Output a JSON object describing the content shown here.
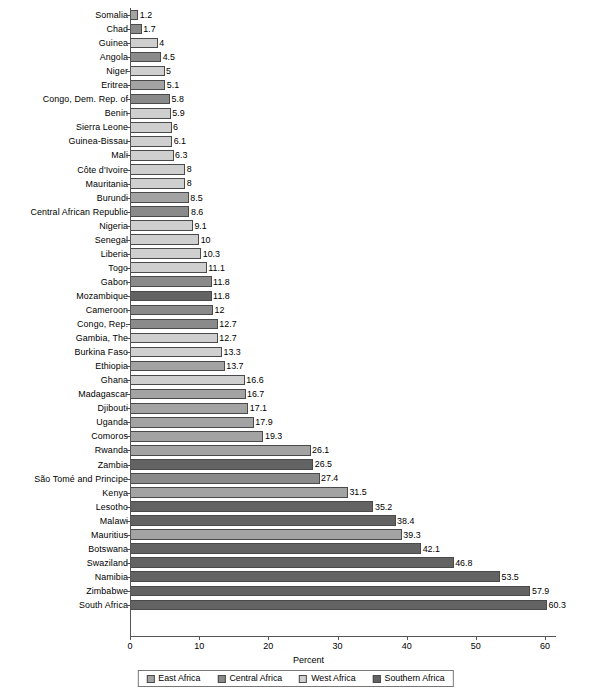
{
  "chart_data": {
    "type": "bar",
    "orientation": "horizontal",
    "title": "",
    "xlabel": "Percent",
    "ylabel": "",
    "xlim": [
      0,
      63
    ],
    "xticks": [
      0,
      10,
      20,
      30,
      40,
      50,
      60
    ],
    "grid": false,
    "legend_position": "bottom",
    "categories": [
      "Somalia",
      "Chad",
      "Guinea",
      "Angola",
      "Niger",
      "Eritrea",
      "Congo, Dem. Rep. of",
      "Benin",
      "Sierra Leone",
      "Guinea-Bissau",
      "Mali",
      "Côte d'Ivoire",
      "Mauritania",
      "Burundi",
      "Central African Republic",
      "Nigeria",
      "Senegal",
      "Liberia",
      "Togo",
      "Gabon",
      "Mozambique",
      "Cameroon",
      "Congo, Rep.",
      "Gambia, The",
      "Burkina Faso",
      "Ethiopia",
      "Ghana",
      "Madagascar",
      "Djibouti",
      "Uganda",
      "Comoros",
      "Rwanda",
      "Zambia",
      "São Tomé and Principe",
      "Kenya",
      "Lesotho",
      "Malawi",
      "Mauritius",
      "Botswana",
      "Swaziland",
      "Namibia",
      "Zimbabwe",
      "South Africa"
    ],
    "values": [
      1.2,
      1.7,
      4,
      4.5,
      5,
      5.1,
      5.8,
      5.9,
      6,
      6.1,
      6.3,
      8,
      8,
      8.5,
      8.6,
      9.1,
      10,
      10.3,
      11.1,
      11.8,
      11.8,
      12,
      12.7,
      12.7,
      13.3,
      13.7,
      16.6,
      16.7,
      17.1,
      17.9,
      19.3,
      26.1,
      26.5,
      27.4,
      31.5,
      35.2,
      38.4,
      39.3,
      42.1,
      46.8,
      53.5,
      57.9,
      60.3
    ],
    "value_labels": [
      "1.2",
      "1.7",
      "4",
      "4.5",
      "5",
      "5.1",
      "5.8",
      "5.9",
      "6",
      "6.1",
      "6.3",
      "8",
      "8",
      "8.5",
      "8.6",
      "9.1",
      "10",
      "10.3",
      "11.1",
      "11.8",
      "11.8",
      "12",
      "12.7",
      "12.7",
      "13.3",
      "13.7",
      "16.6",
      "16.7",
      "17.1",
      "17.9",
      "19.3",
      "26.1",
      "26.5",
      "27.4",
      "31.5",
      "35.2",
      "38.4",
      "39.3",
      "42.1",
      "46.8",
      "53.5",
      "57.9",
      "60.3"
    ],
    "groups": [
      "East Africa",
      "Central Africa",
      "West Africa",
      "Central Africa",
      "West Africa",
      "East Africa",
      "Central Africa",
      "West Africa",
      "West Africa",
      "West Africa",
      "West Africa",
      "West Africa",
      "West Africa",
      "East Africa",
      "Central Africa",
      "West Africa",
      "West Africa",
      "West Africa",
      "West Africa",
      "Central Africa",
      "Southern Africa",
      "Central Africa",
      "Central Africa",
      "West Africa",
      "West Africa",
      "East Africa",
      "West Africa",
      "East Africa",
      "East Africa",
      "East Africa",
      "East Africa",
      "East Africa",
      "Southern Africa",
      "Central Africa",
      "East Africa",
      "Southern Africa",
      "Southern Africa",
      "East Africa",
      "Southern Africa",
      "Southern Africa",
      "Southern Africa",
      "Southern Africa",
      "Southern Africa"
    ],
    "group_colors": {
      "East Africa": "#a3a3a3",
      "Central Africa": "#8a8a8a",
      "West Africa": "#cfcfcf",
      "Southern Africa": "#636363"
    }
  },
  "axis": {
    "x_title": "Percent",
    "tick_labels": [
      "0",
      "10",
      "20",
      "30",
      "40",
      "50",
      "60"
    ]
  },
  "legend": {
    "items": [
      {
        "label": "East Africa",
        "color": "#a3a3a3"
      },
      {
        "label": "Central Africa",
        "color": "#8a8a8a"
      },
      {
        "label": "West Africa",
        "color": "#cfcfcf"
      },
      {
        "label": "Southern Africa",
        "color": "#636363"
      }
    ]
  }
}
